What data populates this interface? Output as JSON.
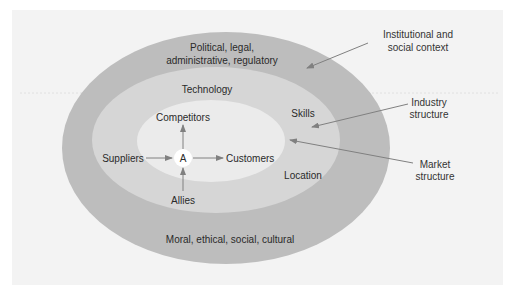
{
  "diagram": {
    "colors": {
      "background": "#f3f3f3",
      "outer_ring": "#bdbdbd",
      "middle_ring": "#d6d6d6",
      "inner_ring": "#ebebeb",
      "center_circle": "#ffffff",
      "arrow": "#808080",
      "text": "#2a2a2a"
    },
    "rings": {
      "outer": {
        "top_label_line1": "Political, legal,",
        "top_label_line2": "administrative, regulatory",
        "bottom_label": "Moral, ethical, social, cultural"
      },
      "middle": {
        "top_label": "Technology",
        "right_upper_label": "Skills",
        "right_lower_label": "Location"
      },
      "inner": {
        "center": "A",
        "top": "Competitors",
        "left": "Suppliers",
        "right": "Customers",
        "bottom": "Allies"
      }
    },
    "callouts": [
      {
        "line1": "Institutional and",
        "line2": "social context"
      },
      {
        "line1": "Industry",
        "line2": "structure"
      },
      {
        "line1": "Market",
        "line2": "structure"
      }
    ]
  }
}
